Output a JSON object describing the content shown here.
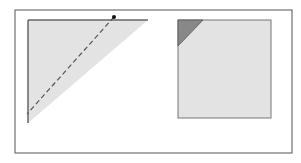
{
  "diagram": {
    "canvas": {
      "width": 301,
      "height": 163,
      "background": "#ffffff"
    },
    "frame": {
      "x": 15,
      "y": 10,
      "width": 277,
      "height": 143,
      "stroke": "#555555"
    },
    "left_panel": {
      "triangle": {
        "points": "28,20 148,20 28,123",
        "fill": "#e3e3e3"
      },
      "top_edge": {
        "x1": 28,
        "y1": 20,
        "x2": 148,
        "y2": 20,
        "stroke": "#666666"
      },
      "left_edge": {
        "x1": 28,
        "y1": 20,
        "x2": 28,
        "y2": 123,
        "stroke": "#666666"
      },
      "dashed_line": {
        "x1": 114,
        "y1": 17,
        "x2": 27,
        "y2": 114,
        "stroke": "#555555",
        "dash": "5,3"
      },
      "dot": {
        "cx": 114,
        "cy": 17,
        "r": 2,
        "fill": "#111111"
      }
    },
    "right_panel": {
      "square": {
        "x": 178,
        "y": 20,
        "width": 93,
        "height": 98,
        "fill": "#e3e3e3",
        "stroke": "#777777"
      },
      "corner_triangle": {
        "points": "178,20 203,20 178,46",
        "fill": "#888888",
        "stroke": "#555555"
      }
    }
  }
}
